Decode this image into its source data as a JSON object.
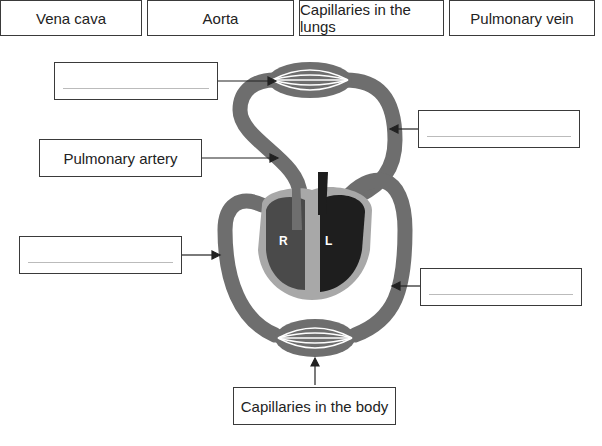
{
  "word_bank": [
    {
      "label": "Vena cava"
    },
    {
      "label": "Aorta"
    },
    {
      "label": "Capillaries in the lungs"
    },
    {
      "label": "Pulmonary vein"
    }
  ],
  "labels": {
    "pulmonary_artery": "Pulmonary artery",
    "capillaries_body": "Capillaries in the body",
    "blank_top_left": "",
    "blank_top_right": "",
    "blank_mid_left": "",
    "blank_mid_right": ""
  },
  "heart": {
    "right_chamber": "R",
    "left_chamber": "L"
  },
  "colors": {
    "vessel": "#6e6e6e",
    "right_heart": "#4a4a4a",
    "left_heart": "#1e1e1e",
    "heart_wall": "#a8a8a8"
  }
}
